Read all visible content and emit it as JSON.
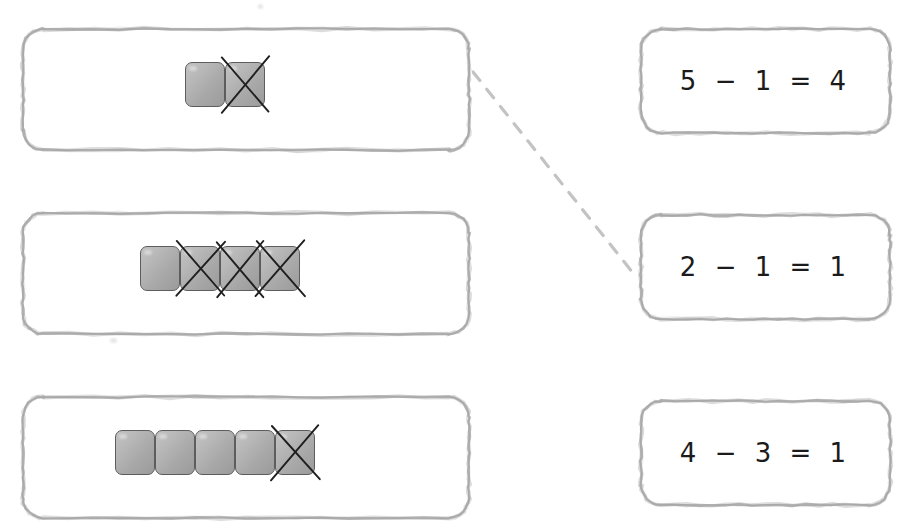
{
  "worksheet": {
    "type": "matching-exercise",
    "subject": "subtraction",
    "canvas": {
      "width": 910,
      "height": 531
    },
    "colors": {
      "border": "#9a9a9a",
      "block_fill_light": "#c2c2c2",
      "block_fill_dark": "#9b9b9b",
      "block_outline": "#5d5d5d",
      "cross_stroke": "#1f1f1f",
      "equation_text": "#1b1b1b",
      "connector": "#c3c3c3",
      "background": "#ffffff"
    }
  },
  "left_column": {
    "label": "block-model-panels",
    "panels": [
      {
        "id": "blocks-panel-1",
        "name": "blocks-panel-2-minus-1",
        "total_blocks": 2,
        "crossed_out": 1,
        "remaining": 1,
        "crossed_indices": [
          1
        ],
        "answer_equation": "2 − 1 = 1",
        "x": 20,
        "y": 26,
        "width": 452,
        "height": 127,
        "blocks_left": 185,
        "blocks_top": 62
      },
      {
        "id": "blocks-panel-2",
        "name": "blocks-panel-4-minus-3",
        "total_blocks": 4,
        "crossed_out": 3,
        "remaining": 1,
        "crossed_indices": [
          1,
          2,
          3
        ],
        "answer_equation": "4 − 3 = 1",
        "x": 20,
        "y": 210,
        "width": 452,
        "height": 127,
        "blocks_left": 140,
        "blocks_top": 246
      },
      {
        "id": "blocks-panel-3",
        "name": "blocks-panel-5-minus-1",
        "total_blocks": 5,
        "crossed_out": 1,
        "remaining": 4,
        "crossed_indices": [
          4
        ],
        "answer_equation": "5 − 1 = 4",
        "x": 20,
        "y": 394,
        "width": 452,
        "height": 127,
        "blocks_left": 115,
        "blocks_top": 430
      }
    ]
  },
  "right_column": {
    "label": "equation-panels",
    "panels": [
      {
        "id": "equation-panel-1",
        "name": "equation-5-minus-1-equals-4",
        "text": "5 − 1 = 4",
        "minuend": 5,
        "subtrahend": 1,
        "difference": 4,
        "x": 638,
        "y": 26,
        "width": 255,
        "height": 110
      },
      {
        "id": "equation-panel-2",
        "name": "equation-2-minus-1-equals-1",
        "text": "2 − 1 = 1",
        "minuend": 2,
        "subtrahend": 1,
        "difference": 1,
        "x": 638,
        "y": 212,
        "width": 255,
        "height": 110
      },
      {
        "id": "equation-panel-3",
        "name": "equation-4-minus-3-equals-1",
        "text": "4 − 3 = 1",
        "minuend": 4,
        "subtrahend": 3,
        "difference": 1,
        "x": 638,
        "y": 398,
        "width": 255,
        "height": 110
      }
    ]
  },
  "connections": [
    {
      "id": "connection-1",
      "name": "match-line-panel1-to-equation2",
      "from": "blocks-panel-1",
      "to": "equation-panel-2",
      "x1": 473,
      "y1": 72,
      "x2": 637,
      "y2": 278,
      "style": "dashed",
      "color": "#c3c3c3"
    }
  ]
}
